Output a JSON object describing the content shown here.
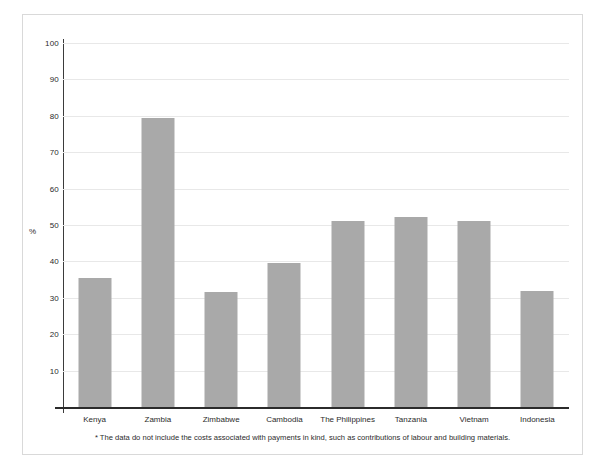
{
  "chart_data": {
    "type": "bar",
    "title": "",
    "xlabel": "",
    "ylabel": "%",
    "ylim": [
      0,
      100
    ],
    "ytick_step": 10,
    "yticks": [
      100,
      90,
      80,
      70,
      60,
      50,
      40,
      30,
      20,
      10
    ],
    "grid": true,
    "legend": "none",
    "bar_color": "#a9a9a9",
    "categories": [
      "Kenya",
      "Zambia",
      "Zimbabwe",
      "Cambodia",
      "The Philippines",
      "Tanzania",
      "Vietnam",
      "Indonesia"
    ],
    "values": [
      35.5,
      79.5,
      31.7,
      39.5,
      51.0,
      52.2,
      51.0,
      31.8
    ],
    "annotations": [
      "* The data do not include the costs associated with payments in kind, such as contributions of labour and building materials."
    ]
  },
  "figure": {
    "footnote": "* The data do not include the costs associated with payments in kind, such as contributions of labour and building materials."
  }
}
